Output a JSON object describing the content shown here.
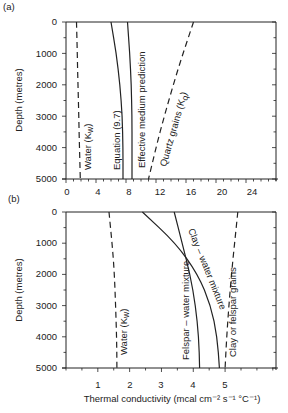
{
  "chart_data": [
    {
      "type": "line",
      "panel_label": "(a)",
      "xlabel": "",
      "ylabel": "Depth (metres)",
      "xlim": [
        0,
        28
      ],
      "ylim": [
        5000,
        0
      ],
      "xticks": [
        0,
        4,
        8,
        12,
        16,
        20,
        24
      ],
      "yticks": [
        0,
        1000,
        2000,
        3000,
        4000,
        5000
      ],
      "y_inverted": true,
      "series": [
        {
          "name": "Water (Kw)",
          "style": "dashed",
          "depth": [
            0,
            1000,
            2000,
            3000,
            4000,
            5000
          ],
          "values": [
            1.4,
            1.5,
            1.6,
            1.7,
            1.8,
            1.9
          ]
        },
        {
          "name": "Equation (9.7)",
          "style": "solid",
          "depth": [
            0,
            1000,
            2000,
            3000,
            4000,
            5000
          ],
          "values": [
            6.0,
            6.7,
            7.2,
            7.5,
            7.6,
            7.6
          ]
        },
        {
          "name": "Effective medium prediction",
          "style": "solid",
          "depth": [
            0,
            1000,
            2000,
            3000,
            4000,
            5000
          ],
          "values": [
            8.2,
            8.5,
            8.7,
            8.8,
            8.8,
            8.8
          ]
        },
        {
          "name": "Quartz grains (Kq)",
          "style": "dashed",
          "depth": [
            0,
            1000,
            2000,
            3000,
            4000,
            5000
          ],
          "values": [
            17.0,
            15.6,
            14.3,
            13.1,
            12.0,
            11.0
          ]
        }
      ]
    },
    {
      "type": "line",
      "panel_label": "(b)",
      "xlabel": "Thermal conductivity  (mcal cm⁻² s⁻¹ °C⁻¹)",
      "ylabel": "Depth (metres)",
      "xlim": [
        0,
        6.6
      ],
      "ylim": [
        5000,
        0
      ],
      "xticks": [
        1,
        2,
        3,
        4,
        5
      ],
      "yticks": [
        0,
        1000,
        2000,
        3000,
        4000,
        5000
      ],
      "y_inverted": true,
      "series": [
        {
          "name": "Water (Kw)",
          "style": "dashed",
          "depth": [
            0,
            1000,
            2000,
            3000,
            4000,
            5000
          ],
          "values": [
            1.35,
            1.45,
            1.52,
            1.56,
            1.59,
            1.6
          ]
        },
        {
          "name": "Felspar – water mixture",
          "style": "solid",
          "depth": [
            0,
            1000,
            2000,
            3000,
            4000,
            5000
          ],
          "values": [
            3.4,
            3.65,
            3.9,
            4.07,
            4.17,
            4.2
          ]
        },
        {
          "name": "Clay – water mixture",
          "style": "solid",
          "depth": [
            0,
            1000,
            2000,
            3000,
            4000,
            5000
          ],
          "values": [
            2.4,
            3.45,
            4.15,
            4.55,
            4.75,
            4.82
          ]
        },
        {
          "name": "Clay or felspar grains",
          "style": "dashed",
          "depth": [
            0,
            1000,
            2000,
            3000,
            4000,
            5000
          ],
          "values": [
            5.4,
            5.3,
            5.2,
            5.12,
            5.05,
            5.0
          ]
        }
      ]
    }
  ],
  "panels": {
    "a": {
      "label": "(a)",
      "ylabel": "Depth (metres)",
      "yticks": [
        "0",
        "1000",
        "2000",
        "3000",
        "4000",
        "5000"
      ],
      "xticks": [
        "0",
        "4",
        "8",
        "12",
        "16",
        "20",
        "24"
      ],
      "curve_labels": {
        "water": "Water (K",
        "water_sub": "w",
        "equation": "Equation (9.7)",
        "effective": "Effective medium prediction",
        "quartz": "Quartz grains (K",
        "quartz_sub": "q"
      }
    },
    "b": {
      "label": "(b)",
      "ylabel": "Depth (metres)",
      "yticks": [
        "0",
        "1000",
        "2000",
        "3000",
        "4000",
        "5000"
      ],
      "xticks": [
        "1",
        "2",
        "3",
        "4",
        "5"
      ],
      "xlabel": "Thermal conductivity  (mcal cm⁻² s⁻¹ °C⁻¹)",
      "curve_labels": {
        "water": "Water (K",
        "water_sub": "w",
        "felspar": "Felspar – water mixture",
        "clay": "Clay – water mixture",
        "grains": "Clay or felspar grains"
      }
    }
  }
}
